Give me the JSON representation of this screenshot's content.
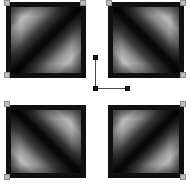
{
  "figure": {
    "title": "Quadrant Gradient Panel",
    "background_color": "#ffffff",
    "width": 190,
    "height": 186
  },
  "assembly": {
    "frame_color": "#101010",
    "cross_color": "#ffffff",
    "cross": {
      "vertical_band_x": [
        80,
        108
      ],
      "horizontal_band_y": [
        76,
        105
      ]
    },
    "panels": [
      {
        "id": "top-left",
        "label": "Top Left Panel",
        "gradient": "diag-main",
        "bright_corners": "top-left, bottom-right",
        "dark_band": "anti-diagonal",
        "x": 0,
        "y": 0,
        "w": 80,
        "h": 76
      },
      {
        "id": "top-right",
        "label": "Top Right Panel",
        "gradient": "diag-anti",
        "bright_corners": "top-right, bottom-left",
        "dark_band": "main-diagonal",
        "x": 102,
        "y": 0,
        "w": 76,
        "h": 76
      },
      {
        "id": "bottom-left",
        "label": "Bottom Left Panel",
        "gradient": "diag-anti",
        "bright_corners": "top-right, bottom-left",
        "dark_band": "main-diagonal",
        "x": 0,
        "y": 103,
        "w": 80,
        "h": 73
      },
      {
        "id": "bottom-right",
        "label": "Bottom Right Panel",
        "gradient": "diag-main",
        "bright_corners": "top-left, bottom-right",
        "dark_band": "anti-diagonal",
        "x": 102,
        "y": 103,
        "w": 76,
        "h": 73
      }
    ],
    "corner_handles": {
      "color": "#bdbdbd",
      "border_color": "#8f8f8f",
      "size": 6,
      "count": 8
    }
  },
  "annotation": {
    "label": "Leader Line Marker",
    "line_color": "#4a4a4a",
    "handle_color": "#1a1a1a",
    "points": {
      "top_handle": {
        "x": 93,
        "y": 55
      },
      "elbow_handle": {
        "x": 93,
        "y": 86
      },
      "end_handle": {
        "x": 125,
        "y": 86
      }
    },
    "segments": [
      {
        "orientation": "vertical",
        "x": 95,
        "y1": 59,
        "y2": 88
      },
      {
        "orientation": "horizontal",
        "y": 88,
        "x1": 96,
        "x2": 126
      }
    ]
  }
}
